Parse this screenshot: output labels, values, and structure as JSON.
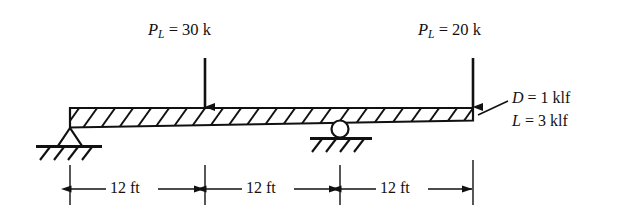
{
  "figure": {
    "type": "beam-free-body-diagram",
    "stroke_color": "#111111",
    "background_color": "#ffffff"
  },
  "point_loads": [
    {
      "symbol": "P",
      "subscript": "L",
      "equals": "=",
      "value": "30",
      "unit": "k",
      "text": "P_L = 30 k",
      "arrow_x_ft": 12,
      "direction": "down"
    },
    {
      "symbol": "P",
      "subscript": "L",
      "equals": "=",
      "value": "20",
      "unit": "k",
      "text": "P_L = 20 k",
      "arrow_x_ft": 36,
      "direction": "down"
    }
  ],
  "distributed_loads": [
    {
      "symbol": "D",
      "equals": "=",
      "value": "1",
      "unit": "klf",
      "text": "D = 1 klf"
    },
    {
      "symbol": "L",
      "equals": "=",
      "value": "3",
      "unit": "klf",
      "text": "L = 3 klf"
    }
  ],
  "dimensions": [
    {
      "label": "12 ft",
      "value": 12,
      "unit": "ft",
      "from_ft": 0,
      "to_ft": 12
    },
    {
      "label": "12 ft",
      "value": 12,
      "unit": "ft",
      "from_ft": 12,
      "to_ft": 24
    },
    {
      "label": "12 ft",
      "value": 12,
      "unit": "ft",
      "from_ft": 24,
      "to_ft": 36
    }
  ],
  "supports": [
    {
      "kind": "pin",
      "name": "pinned-support",
      "at_ft": 0
    },
    {
      "kind": "roller",
      "name": "roller-support",
      "at_ft": 24
    }
  ],
  "beam": {
    "name": "tapered-beam",
    "hatched": true,
    "span_ft": 36,
    "depth_left": "deep",
    "depth_right": "shallow"
  }
}
